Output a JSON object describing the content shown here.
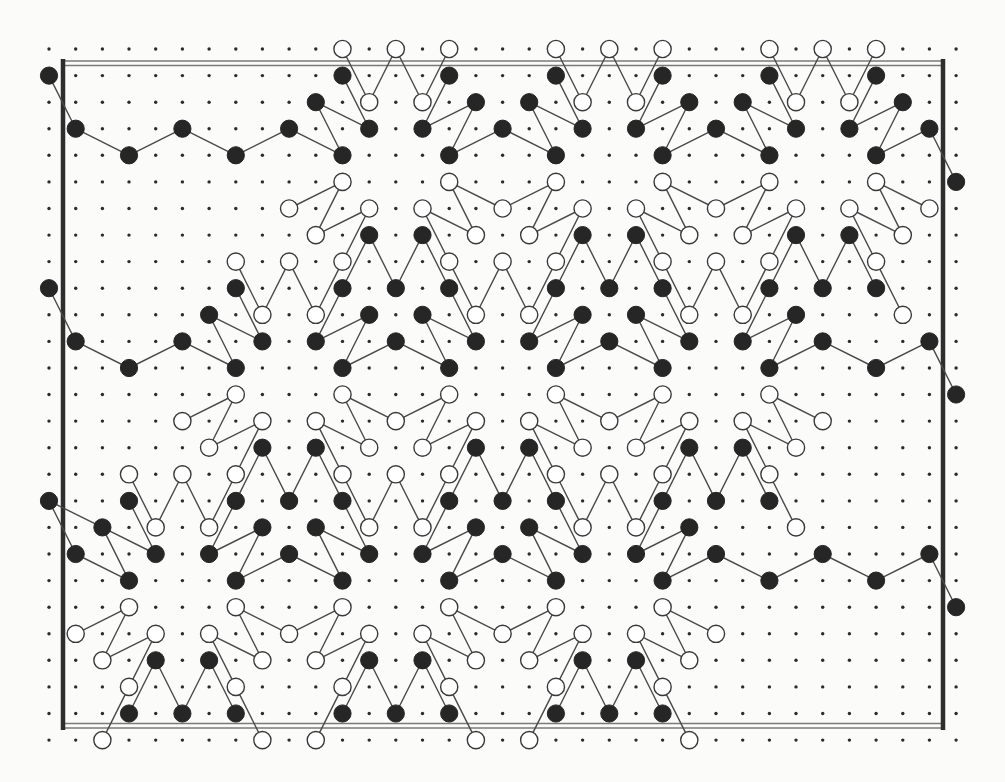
{
  "figure": {
    "type": "lattice-diagram",
    "grid": {
      "cols": 35,
      "rows": 27,
      "origin_x": 49,
      "origin_y": 49,
      "step_x": 26.68,
      "step_y": 26.58,
      "dot_radius": 1.7,
      "node_radius": 8.6
    },
    "colors": {
      "background": "#fbfbf9",
      "black_node": "#262626",
      "white_node_fill": "#ffffff",
      "white_node_stroke": "#3a3a3a",
      "edge": "#4a4a4a",
      "dot": "#2b2b2b",
      "frame_thick": "#2e2e2e",
      "frame_thin": "#7a7a7a"
    },
    "frame": {
      "left_x": 63,
      "right_x": 943,
      "top_y": 61,
      "top_y2": 65.5,
      "bottom_y": 723.5,
      "bottom_y2": 728,
      "wall_top": 59,
      "wall_bottom": 730
    },
    "edge_rule": "connect same-colored nodes separated by a knight move (|dc|,|dr|) in {(1,2),(2,1)}",
    "rows": [
      {
        "r": 0,
        "black": [],
        "white": [
          11,
          13,
          15,
          19,
          21,
          23,
          27,
          29,
          31
        ]
      },
      {
        "r": 1,
        "black": [
          0,
          11,
          15,
          19,
          23,
          27,
          31
        ],
        "white": []
      },
      {
        "r": 2,
        "black": [
          10,
          16,
          18,
          24,
          26,
          32
        ],
        "white": [
          12,
          14,
          20,
          22,
          28,
          30
        ]
      },
      {
        "r": 3,
        "black": [
          1,
          5,
          9,
          12,
          14,
          17,
          20,
          22,
          25,
          28,
          30,
          33
        ],
        "white": []
      },
      {
        "r": 4,
        "black": [
          3,
          7,
          11,
          15,
          19,
          23,
          27,
          31
        ],
        "white": []
      },
      {
        "r": 5,
        "black": [
          34
        ],
        "white": [
          11,
          15,
          19,
          23,
          27,
          31
        ]
      },
      {
        "r": 6,
        "black": [],
        "white": [
          9,
          12,
          14,
          17,
          20,
          22,
          25,
          28,
          30,
          33
        ]
      },
      {
        "r": 7,
        "black": [
          12,
          14,
          20,
          22,
          28,
          30
        ],
        "white": [
          10,
          16,
          18,
          24,
          26,
          32
        ]
      },
      {
        "r": 8,
        "black": [],
        "white": [
          7,
          9,
          11,
          15,
          17,
          19,
          23,
          25,
          27,
          31
        ]
      },
      {
        "r": 9,
        "black": [
          0,
          7,
          11,
          13,
          15,
          19,
          21,
          23,
          27,
          29,
          31
        ],
        "white": []
      },
      {
        "r": 10,
        "black": [
          6,
          12,
          14,
          20,
          22,
          28
        ],
        "white": [
          8,
          10,
          16,
          18,
          24,
          26,
          32
        ]
      },
      {
        "r": 11,
        "black": [
          1,
          5,
          8,
          10,
          13,
          16,
          18,
          21,
          24,
          26,
          29,
          33
        ],
        "white": []
      },
      {
        "r": 12,
        "black": [
          3,
          7,
          11,
          15,
          19,
          23,
          27,
          31
        ],
        "white": []
      },
      {
        "r": 13,
        "black": [
          34
        ],
        "white": [
          7,
          11,
          15,
          19,
          23,
          27
        ]
      },
      {
        "r": 14,
        "black": [],
        "white": [
          5,
          8,
          10,
          13,
          16,
          18,
          21,
          24,
          26,
          29
        ]
      },
      {
        "r": 15,
        "black": [
          8,
          10,
          16,
          18,
          24,
          26
        ],
        "white": [
          6,
          12,
          14,
          20,
          22,
          28
        ]
      },
      {
        "r": 16,
        "black": [],
        "white": [
          3,
          5,
          7,
          11,
          13,
          15,
          19,
          21,
          23,
          27
        ]
      },
      {
        "r": 17,
        "black": [
          0,
          3,
          7,
          9,
          11,
          15,
          17,
          19,
          23,
          25,
          27
        ],
        "white": []
      },
      {
        "r": 18,
        "black": [
          2,
          8,
          10,
          16,
          18,
          24
        ],
        "white": [
          4,
          6,
          12,
          14,
          20,
          22,
          28
        ]
      },
      {
        "r": 19,
        "black": [
          1,
          4,
          6,
          9,
          12,
          14,
          17,
          20,
          22,
          25,
          29,
          33
        ],
        "white": []
      },
      {
        "r": 20,
        "black": [
          3,
          7,
          11,
          15,
          19,
          23,
          27,
          31
        ],
        "white": []
      },
      {
        "r": 21,
        "black": [
          34
        ],
        "white": [
          3,
          7,
          11,
          15,
          19,
          23
        ]
      },
      {
        "r": 22,
        "black": [],
        "white": [
          1,
          4,
          6,
          9,
          12,
          14,
          17,
          20,
          22,
          25
        ]
      },
      {
        "r": 23,
        "black": [
          4,
          6,
          12,
          14,
          20,
          22
        ],
        "white": [
          2,
          8,
          10,
          16,
          18,
          24
        ]
      },
      {
        "r": 24,
        "black": [],
        "white": [
          3,
          7,
          11,
          15,
          19,
          23
        ]
      },
      {
        "r": 25,
        "black": [
          3,
          5,
          7,
          11,
          13,
          15,
          19,
          21,
          23
        ],
        "white": []
      },
      {
        "r": 26,
        "black": [],
        "white": [
          2,
          8,
          10,
          16,
          18,
          24
        ]
      }
    ]
  }
}
